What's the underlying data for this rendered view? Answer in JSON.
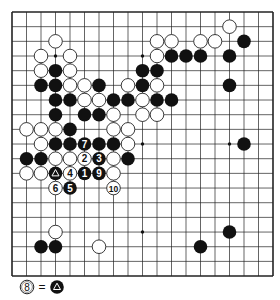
{
  "board": {
    "size": 19,
    "origin_x": 12,
    "origin_y": 12,
    "dx": 14.5,
    "dy": 14.67,
    "stone_radius": 6.8,
    "line_color": "#222222",
    "star_points": [
      [
        3,
        3
      ],
      [
        9,
        3
      ],
      [
        15,
        3
      ],
      [
        3,
        9
      ],
      [
        9,
        9
      ],
      [
        15,
        9
      ],
      [
        3,
        15
      ],
      [
        9,
        15
      ],
      [
        15,
        15
      ]
    ],
    "stones": [
      {
        "c": 15,
        "r": 1,
        "color": "W"
      },
      {
        "c": 3,
        "r": 2,
        "color": "W"
      },
      {
        "c": 10,
        "r": 2,
        "color": "W"
      },
      {
        "c": 11,
        "r": 2,
        "color": "W"
      },
      {
        "c": 13,
        "r": 2,
        "color": "W"
      },
      {
        "c": 14,
        "r": 2,
        "color": "W"
      },
      {
        "c": 16,
        "r": 2,
        "color": "B"
      },
      {
        "c": 2,
        "r": 3,
        "color": "W"
      },
      {
        "c": 4,
        "r": 3,
        "color": "W"
      },
      {
        "c": 10,
        "r": 3,
        "color": "W"
      },
      {
        "c": 11,
        "r": 3,
        "color": "B"
      },
      {
        "c": 12,
        "r": 3,
        "color": "B"
      },
      {
        "c": 13,
        "r": 3,
        "color": "B"
      },
      {
        "c": 15,
        "r": 3,
        "color": "B"
      },
      {
        "c": 2,
        "r": 4,
        "color": "W"
      },
      {
        "c": 3,
        "r": 4,
        "color": "B"
      },
      {
        "c": 4,
        "r": 4,
        "color": "W"
      },
      {
        "c": 9,
        "r": 4,
        "color": "B"
      },
      {
        "c": 10,
        "r": 4,
        "color": "B"
      },
      {
        "c": 2,
        "r": 5,
        "color": "B"
      },
      {
        "c": 3,
        "r": 5,
        "color": "B"
      },
      {
        "c": 4,
        "r": 5,
        "color": "W"
      },
      {
        "c": 5,
        "r": 5,
        "color": "W"
      },
      {
        "c": 6,
        "r": 5,
        "color": "B"
      },
      {
        "c": 8,
        "r": 5,
        "color": "W"
      },
      {
        "c": 9,
        "r": 5,
        "color": "B"
      },
      {
        "c": 10,
        "r": 5,
        "color": "W"
      },
      {
        "c": 15,
        "r": 5,
        "color": "B"
      },
      {
        "c": 3,
        "r": 6,
        "color": "B"
      },
      {
        "c": 4,
        "r": 6,
        "color": "B"
      },
      {
        "c": 5,
        "r": 6,
        "color": "W"
      },
      {
        "c": 6,
        "r": 6,
        "color": "W"
      },
      {
        "c": 7,
        "r": 6,
        "color": "B"
      },
      {
        "c": 8,
        "r": 6,
        "color": "B"
      },
      {
        "c": 9,
        "r": 6,
        "color": "W"
      },
      {
        "c": 10,
        "r": 6,
        "color": "B"
      },
      {
        "c": 11,
        "r": 6,
        "color": "B"
      },
      {
        "c": 3,
        "r": 7,
        "color": "B"
      },
      {
        "c": 5,
        "r": 7,
        "color": "B"
      },
      {
        "c": 6,
        "r": 7,
        "color": "B"
      },
      {
        "c": 7,
        "r": 7,
        "color": "W"
      },
      {
        "c": 9,
        "r": 7,
        "color": "W"
      },
      {
        "c": 10,
        "r": 7,
        "color": "W"
      },
      {
        "c": 1,
        "r": 8,
        "color": "W"
      },
      {
        "c": 2,
        "r": 8,
        "color": "W"
      },
      {
        "c": 3,
        "r": 8,
        "color": "W"
      },
      {
        "c": 4,
        "r": 8,
        "color": "B"
      },
      {
        "c": 7,
        "r": 8,
        "color": "W"
      },
      {
        "c": 8,
        "r": 8,
        "color": "W"
      },
      {
        "c": 2,
        "r": 9,
        "color": "W"
      },
      {
        "c": 3,
        "r": 9,
        "color": "B"
      },
      {
        "c": 4,
        "r": 9,
        "color": "B"
      },
      {
        "c": 5,
        "r": 9,
        "color": "B",
        "label": "7"
      },
      {
        "c": 6,
        "r": 9,
        "color": "B"
      },
      {
        "c": 7,
        "r": 9,
        "color": "B"
      },
      {
        "c": 8,
        "r": 9,
        "color": "W"
      },
      {
        "c": 16,
        "r": 9,
        "color": "B"
      },
      {
        "c": 1,
        "r": 10,
        "color": "B"
      },
      {
        "c": 2,
        "r": 10,
        "color": "B"
      },
      {
        "c": 3,
        "r": 10,
        "color": "W"
      },
      {
        "c": 4,
        "r": 10,
        "color": "W"
      },
      {
        "c": 5,
        "r": 10,
        "color": "W",
        "label": "2"
      },
      {
        "c": 6,
        "r": 10,
        "color": "B",
        "label": "3"
      },
      {
        "c": 7,
        "r": 10,
        "color": "W"
      },
      {
        "c": 8,
        "r": 10,
        "color": "B"
      },
      {
        "c": 1,
        "r": 11,
        "color": "W"
      },
      {
        "c": 2,
        "r": 11,
        "color": "W"
      },
      {
        "c": 3,
        "r": 11,
        "color": "B",
        "mark": "triangle"
      },
      {
        "c": 4,
        "r": 11,
        "color": "W",
        "label": "4"
      },
      {
        "c": 5,
        "r": 11,
        "color": "B",
        "label": "1"
      },
      {
        "c": 6,
        "r": 11,
        "color": "B",
        "label": "9"
      },
      {
        "c": 7,
        "r": 11,
        "color": "W"
      },
      {
        "c": 3,
        "r": 12,
        "color": "W",
        "label": "6"
      },
      {
        "c": 4,
        "r": 12,
        "color": "B",
        "label": "5"
      },
      {
        "c": 7,
        "r": 12,
        "color": "W",
        "label": "10"
      },
      {
        "c": 3,
        "r": 15,
        "color": "W"
      },
      {
        "c": 15,
        "r": 15,
        "color": "B"
      },
      {
        "c": 2,
        "r": 16,
        "color": "B"
      },
      {
        "c": 3,
        "r": 16,
        "color": "B"
      },
      {
        "c": 6,
        "r": 16,
        "color": "W"
      },
      {
        "c": 13,
        "r": 16,
        "color": "B"
      }
    ]
  },
  "legend": {
    "move_label": "8",
    "equals": "=",
    "target_mark": "triangle"
  }
}
